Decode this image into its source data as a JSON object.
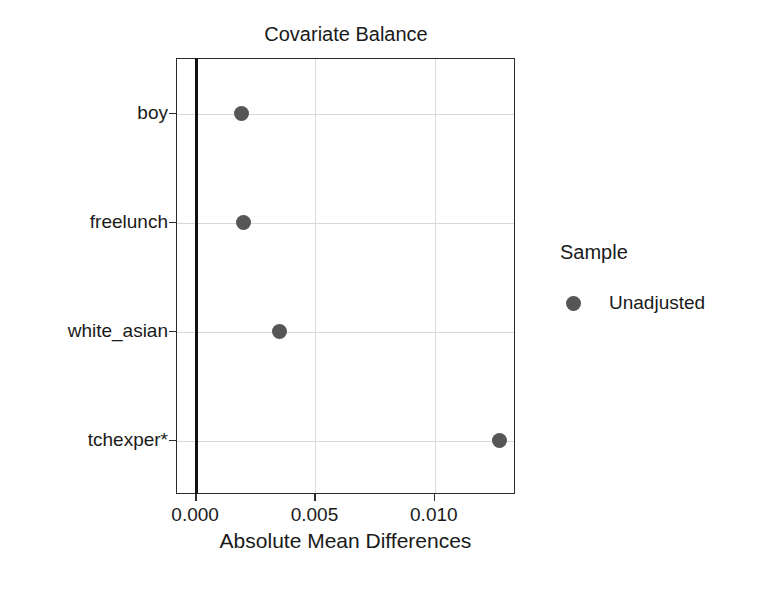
{
  "chart_data": {
    "type": "scatter",
    "title": "Covariate Balance",
    "xlabel": "Absolute Mean Differences",
    "ylabel": "",
    "orientation": "horizontal",
    "grid": true,
    "legend_position": "right",
    "xlim": [
      -0.0008,
      0.0134
    ],
    "xticks": [
      0,
      0.005,
      0.01
    ],
    "xtick_labels": [
      "0.000",
      "0.005",
      "0.010"
    ],
    "categories": [
      "boy",
      "freelunch",
      "white_asian",
      "tchexper*"
    ],
    "series": [
      {
        "name": "Unadjusted",
        "color": "#565656",
        "marker": "circle",
        "values": [
          0.0019,
          0.002,
          0.0035,
          0.0127
        ]
      }
    ],
    "reference_line": {
      "x": 0.0,
      "color": "#111111",
      "label": "0.000"
    },
    "points": [
      {
        "category": "boy",
        "value": 0.0019,
        "series": "Unadjusted"
      },
      {
        "category": "freelunch",
        "value": 0.002,
        "series": "Unadjusted"
      },
      {
        "category": "white_asian",
        "value": 0.0035,
        "series": "Unadjusted"
      },
      {
        "category": "tchexper*",
        "value": 0.0127,
        "series": "Unadjusted"
      }
    ]
  },
  "legend": {
    "title": "Sample",
    "entries": [
      {
        "label": "Unadjusted",
        "color": "#565656"
      }
    ]
  },
  "colors": {
    "point": "#565656",
    "panel_border": "#2b2b2b",
    "gridline": "#d9d9d9",
    "reference_line": "#111111",
    "text": "#1a1a1a",
    "background": "#ffffff"
  }
}
